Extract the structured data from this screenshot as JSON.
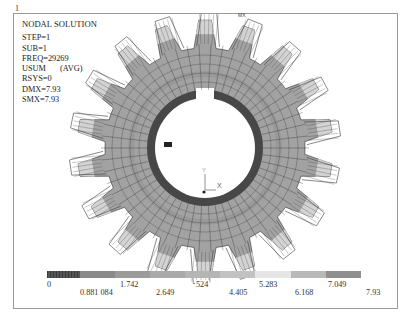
{
  "window": {
    "number": "1"
  },
  "info": {
    "title": "NODAL SOLUTION",
    "lines": {
      "step": "STEP=1",
      "sub": "SUB=1",
      "freq": "FREQ=29269",
      "usum": "USUM",
      "avg": "(AVG)",
      "rsys": "RSYS=0",
      "dmx": "DMX=7.93",
      "smx": "SMX=7.93"
    }
  },
  "axis_triad": {
    "x_label": "X",
    "y_label": "Y"
  },
  "markers": {
    "mx": "MX",
    "mn": "MN"
  },
  "legend": {
    "colors": [
      "#4a4a4a",
      "#8a8a8a",
      "#9b9b9b",
      "#a9a9a9",
      "#b5b5b5",
      "#c2c2c2",
      "#e6e6e6",
      "#b8b8b8",
      "#8f8f8f"
    ],
    "labels": {
      "l0": "0",
      "l1": "0.881 084",
      "l2": "1.742",
      "l3": "2.649",
      "l4": "524",
      "l5": "4.405",
      "l6": "5.283",
      "l7": "6.168",
      "l8": "7.049",
      "l9": "7.93"
    }
  },
  "model": {
    "type": "gear",
    "teeth": 18,
    "colors": {
      "body": "#a2a2a2",
      "inner_ring": "#474747",
      "mid_ring": "#8c8c8c",
      "tooth_tip": "#dcdcdc",
      "mesh_line": "#2f2f2f",
      "deformed_outline": "#3a3a3a"
    }
  }
}
